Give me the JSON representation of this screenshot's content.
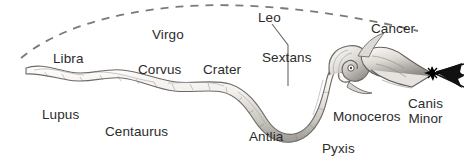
{
  "figure": {
    "background_color": "#ffffff",
    "text_color": "#2b2b2b",
    "width": 464,
    "height": 166
  },
  "artwork": {
    "serpent": {
      "name": "hydra-serpent-body",
      "description": "long pencil-shaded serpent winding from lower left tail to a coiled neck and head at the right",
      "body_fill": "#efece7",
      "shade_color": "#8e8b86",
      "outline_color": "#5c5a57"
    },
    "head": {
      "name": "serpent-head",
      "description": "serpent head with open jaws pointing right, coiled neck loop with an eye"
    },
    "star": {
      "name": "bright-star-burst",
      "description": "black eight-point star with converging rays extending to the right edge",
      "color": "#000000",
      "x": 432,
      "y": 73
    },
    "dashed_arc": {
      "name": "ecliptic-dashed-arc",
      "description": "dashed curved line arcing across the top of the figure from lower left to right",
      "color": "#7c7a77",
      "dash": "7 6"
    },
    "leader_line": {
      "name": "leo-leader-line",
      "description": "thin line from the Leo label bending down past Sextans toward the serpent",
      "color": "#6a6866"
    }
  },
  "labels": [
    {
      "id": "libra",
      "text": "Libra",
      "x": 53,
      "y": 52,
      "lines": [
        "Libra"
      ]
    },
    {
      "id": "virgo",
      "text": "Virgo",
      "x": 152,
      "y": 28,
      "lines": [
        "Virgo"
      ]
    },
    {
      "id": "corvus",
      "text": "Corvus",
      "x": 138,
      "y": 63,
      "lines": [
        "Corvus"
      ]
    },
    {
      "id": "crater",
      "text": "Crater",
      "x": 203,
      "y": 63,
      "lines": [
        "Crater"
      ]
    },
    {
      "id": "leo",
      "text": "Leo",
      "x": 258,
      "y": 11,
      "lines": [
        "Leo"
      ]
    },
    {
      "id": "sextans",
      "text": "Sextans",
      "x": 262,
      "y": 51,
      "lines": [
        "Sextans"
      ]
    },
    {
      "id": "cancer",
      "text": "Cancer",
      "x": 371,
      "y": 22,
      "lines": [
        "Cancer"
      ]
    },
    {
      "id": "lupus",
      "text": "Lupus",
      "x": 42,
      "y": 108,
      "lines": [
        "Lupus"
      ]
    },
    {
      "id": "centaurus",
      "text": "Centaurus",
      "x": 105,
      "y": 125,
      "lines": [
        "Centaurus"
      ]
    },
    {
      "id": "antlia",
      "text": "Antlia",
      "x": 249,
      "y": 130,
      "lines": [
        "Antlia"
      ]
    },
    {
      "id": "monoceros",
      "text": "Monoceros",
      "x": 333,
      "y": 110,
      "lines": [
        "Monoceros"
      ]
    },
    {
      "id": "pyxis",
      "text": "Pyxis",
      "x": 322,
      "y": 142,
      "lines": [
        "Pyxis"
      ]
    },
    {
      "id": "canis-minor",
      "text": "Canis Minor",
      "x": 408,
      "y": 96,
      "lines": [
        "Canis",
        "Minor"
      ]
    }
  ]
}
